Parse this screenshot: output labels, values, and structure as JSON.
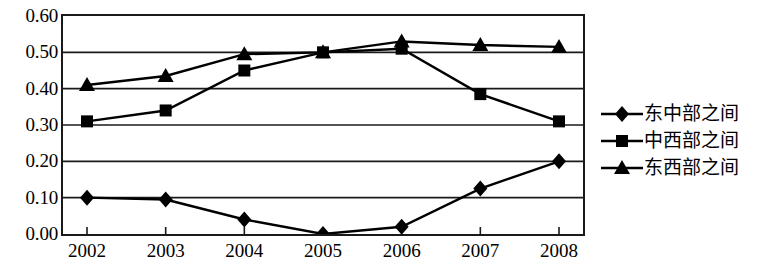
{
  "chart_data": {
    "type": "line",
    "title": "",
    "subtitle": "",
    "xlabel": "",
    "ylabel": "",
    "categories": [
      "2002",
      "2003",
      "2004",
      "2005",
      "2006",
      "2007",
      "2008"
    ],
    "ylim": [
      0.0,
      0.6
    ],
    "yticks": [
      "0.00",
      "0.10",
      "0.20",
      "0.30",
      "0.40",
      "0.50",
      "0.60"
    ],
    "ytick_values": [
      0.0,
      0.1,
      0.2,
      0.3,
      0.4,
      0.5,
      0.6
    ],
    "grid": true,
    "grid_axis": "y",
    "legend_position": "right",
    "series": [
      {
        "name": "东中部之间",
        "marker": "diamond",
        "color": "#000000",
        "values": [
          0.1,
          0.095,
          0.04,
          0.0,
          0.02,
          0.125,
          0.2
        ]
      },
      {
        "name": "中西部之间",
        "marker": "square",
        "color": "#000000",
        "values": [
          0.31,
          0.34,
          0.45,
          0.5,
          0.51,
          0.385,
          0.31
        ]
      },
      {
        "name": "东西部之间",
        "marker": "triangle",
        "color": "#000000",
        "values": [
          0.41,
          0.435,
          0.495,
          0.5,
          0.53,
          0.52,
          0.515
        ]
      }
    ]
  }
}
